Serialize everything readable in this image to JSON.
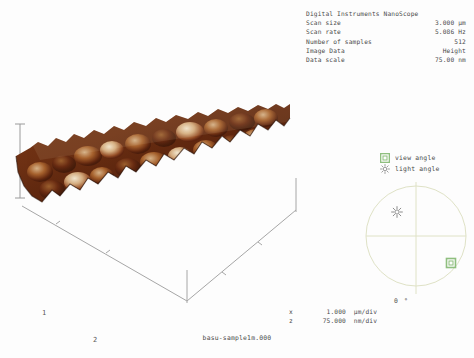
{
  "header": {
    "instrument_title": "Digital Instruments NanoScope",
    "parameters": [
      {
        "label": "Scan size",
        "value": "3.000 µm"
      },
      {
        "label": "Scan rate",
        "value": "5.086 Hz"
      },
      {
        "label": "Number of samples",
        "value": "512"
      },
      {
        "label": "Image Data",
        "value": "Height"
      },
      {
        "label": "Data scale",
        "value": "75.00 nm"
      }
    ]
  },
  "plot": {
    "axis_unit": "µm",
    "x_tick_labels": [
      "1",
      "2"
    ],
    "colors": {
      "surface_low": "#2a0d06",
      "surface_mid": "#8a431f",
      "surface_high": "#f2e2c2",
      "axis_line": "#9a9a9a",
      "background": "#ffffff"
    }
  },
  "scale_legend": {
    "rows": [
      {
        "axis": "x",
        "value": "1.000",
        "unit": "µm/div"
      },
      {
        "axis": "z",
        "value": "75.000",
        "unit": "nm/div"
      }
    ]
  },
  "angle_panel": {
    "view_angle_label": "view angle",
    "light_angle_label": "light angle",
    "view_angle_icon": "green-square-icon",
    "light_angle_icon": "sun-icon",
    "degree_label": "0 °",
    "colors": {
      "marker_green": "#8fbf7f",
      "compass_line": "#d8dcc0",
      "sun_icon": "#8c8c8c"
    }
  },
  "caption": {
    "filename": "basu-sample1m.000"
  }
}
